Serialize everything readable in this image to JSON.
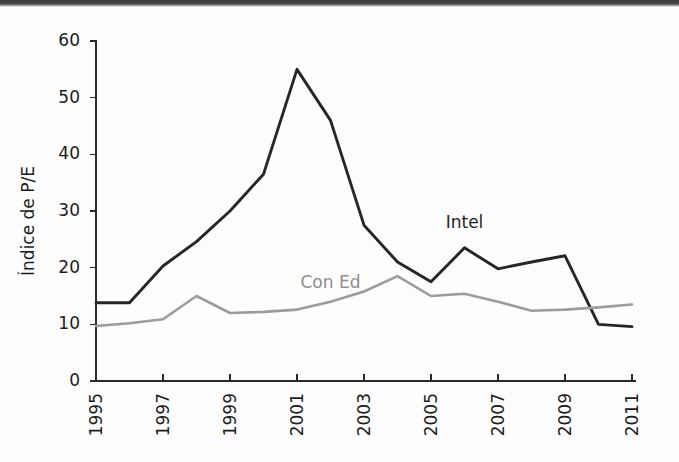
{
  "chart_data": {
    "type": "line",
    "title": "",
    "subtitle": "",
    "xlabel": "",
    "ylabel": "Índice de P/E",
    "xlim": [
      1995,
      2011
    ],
    "ylim": [
      0,
      60
    ],
    "grid": false,
    "legend_position": "inline-annotations",
    "x": [
      1995,
      1996,
      1997,
      1998,
      1999,
      2000,
      2001,
      2002,
      2003,
      2004,
      2005,
      2006,
      2007,
      2008,
      2009,
      2010,
      2011
    ],
    "xtick_labels": [
      "1995",
      "1997",
      "1999",
      "2001",
      "2003",
      "2005",
      "2007",
      "2009",
      "2011"
    ],
    "xtick_values": [
      1995,
      1997,
      1999,
      2001,
      2003,
      2005,
      2007,
      2009,
      2011
    ],
    "ytick_labels": [
      "0",
      "10",
      "20",
      "30",
      "40",
      "50",
      "60"
    ],
    "ytick_values": [
      0,
      10,
      20,
      30,
      40,
      50,
      60
    ],
    "series": [
      {
        "name": "Intel",
        "color": "#262626",
        "stroke_width": 2.9,
        "label_x": 2006,
        "label_y": 27.0,
        "values": [
          13.8,
          13.8,
          20.3,
          24.6,
          30.0,
          36.5,
          55.0,
          46.0,
          27.5,
          21.0,
          17.5,
          23.5,
          19.8,
          21.0,
          22.1,
          10.0,
          9.6
        ]
      },
      {
        "name": "Con Ed",
        "color": "#9c9c9c",
        "stroke_width": 2.6,
        "label_x": 2002,
        "label_y": 16.4,
        "values": [
          9.7,
          10.2,
          10.9,
          15.0,
          12.0,
          12.2,
          12.6,
          14.0,
          15.8,
          18.5,
          15.0,
          15.4,
          14.0,
          12.4,
          12.6,
          13.0,
          13.5
        ]
      }
    ]
  },
  "figure": {
    "y_axis_title": "Índice de P/E",
    "annotations": [
      {
        "text": "Intel"
      },
      {
        "text": "Con Ed"
      }
    ]
  }
}
